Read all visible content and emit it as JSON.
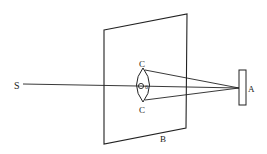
{
  "diagram": {
    "labels": {
      "source": "S",
      "screen": "B",
      "lens_top": "C",
      "lens_bottom": "C",
      "lens_center": "O",
      "lens_center_sub": "6",
      "target": "A"
    },
    "colors": {
      "stroke": "#222222",
      "background": "#ffffff"
    }
  }
}
